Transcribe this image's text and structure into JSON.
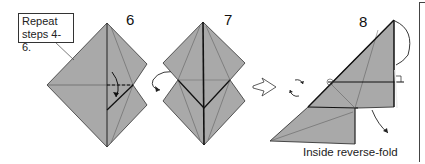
{
  "colors": {
    "paper": "#a9a9a9",
    "line": "#222222",
    "crease": "#555555",
    "background": "#ffffff"
  },
  "steps": [
    {
      "number": "6",
      "callout": {
        "line1": "Repeat",
        "line2": "steps 4-6."
      }
    },
    {
      "number": "7"
    },
    {
      "number": "8",
      "caption": "Inside reverse-fold"
    }
  ],
  "icons": [
    "turn-over-arrow-icon",
    "next-step-arrow-icon",
    "rotate-icon",
    "fold-arrow-icon",
    "right-angle-marker-icon"
  ]
}
